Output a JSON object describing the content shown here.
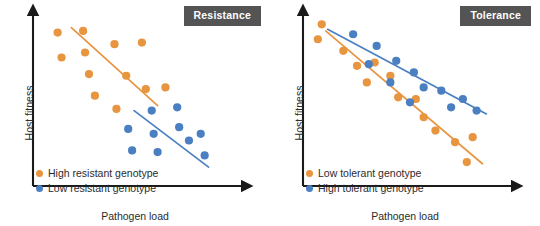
{
  "figure": {
    "background": "#ffffff",
    "colors": {
      "orange": "#E8953F",
      "blue": "#4A7FC1",
      "axis": "#1a1a1a",
      "badge_bg": "#545454",
      "badge_text": "#ffffff",
      "text": "#2b2b2b"
    }
  },
  "panels": [
    {
      "id": "resistance",
      "badge": "Resistance",
      "xlabel": "Pathogen load",
      "ylabel": "Host fitness",
      "legend": [
        {
          "label": "High resistant genotype",
          "color": "#E8953F",
          "series": "orange"
        },
        {
          "label": "Low resistant genotype",
          "color": "#4A7FC1",
          "series": "blue"
        }
      ],
      "chart_data": {
        "type": "scatter",
        "title": "Resistance",
        "xlabel": "Pathogen load",
        "ylabel": "Host fitness",
        "xlim": [
          0,
          100
        ],
        "ylim": [
          0,
          100
        ],
        "grid": false,
        "axis_ticks": false,
        "legend_position": "bottom-left",
        "series": [
          {
            "name": "High resistant genotype",
            "color": "#E8953F",
            "points": [
              [
                9,
                90
              ],
              [
                22,
                91
              ],
              [
                11,
                75
              ],
              [
                23,
                78
              ],
              [
                38,
                83
              ],
              [
                52,
                84
              ],
              [
                25,
                65
              ],
              [
                44,
                64
              ],
              [
                28,
                52
              ],
              [
                54,
                56
              ],
              [
                39,
                44
              ],
              [
                64,
                57
              ]
            ],
            "trend_line": {
              "x0": 16,
              "y0": 93,
              "x1": 60,
              "y1": 46
            }
          },
          {
            "name": "Low resistant genotype",
            "color": "#4A7FC1",
            "points": [
              [
                57,
                43
              ],
              [
                70,
                45
              ],
              [
                45,
                32
              ],
              [
                58,
                29
              ],
              [
                71,
                33
              ],
              [
                47,
                19
              ],
              [
                60,
                18
              ],
              [
                76,
                25
              ],
              [
                82,
                29
              ],
              [
                84,
                16
              ]
            ],
            "trend_line": {
              "x0": 48,
              "y0": 43,
              "x1": 86,
              "y1": 9
            }
          }
        ]
      }
    },
    {
      "id": "tolerance",
      "badge": "Tolerance",
      "xlabel": "Pathogen load",
      "ylabel": "Host fitness",
      "legend": [
        {
          "label": "Low tolerant genotype",
          "color": "#E8953F",
          "series": "orange"
        },
        {
          "label": "High tolerant genotype",
          "color": "#4A7FC1",
          "series": "blue"
        }
      ],
      "chart_data": {
        "type": "scatter",
        "title": "Tolerance",
        "xlabel": "Pathogen load",
        "ylabel": "Host fitness",
        "xlim": [
          0,
          100
        ],
        "ylim": [
          0,
          100
        ],
        "grid": false,
        "axis_ticks": false,
        "legend_position": "bottom-left",
        "series": [
          {
            "name": "Low tolerant genotype",
            "color": "#E8953F",
            "points": [
              [
                6,
                95
              ],
              [
                4,
                86
              ],
              [
                17,
                79
              ],
              [
                24,
                70
              ],
              [
                33,
                72
              ],
              [
                29,
                60
              ],
              [
                41,
                64
              ],
              [
                45,
                51
              ],
              [
                54,
                50
              ],
              [
                58,
                39
              ],
              [
                64,
                31
              ],
              [
                74,
                24
              ],
              [
                83,
                27
              ],
              [
                80,
                12
              ]
            ],
            "trend_line": {
              "x0": 8,
              "y0": 91,
              "x1": 88,
              "y1": 11
            }
          },
          {
            "name": "High tolerant genotype",
            "color": "#4A7FC1",
            "points": [
              [
                22,
                89
              ],
              [
                34,
                82
              ],
              [
                30,
                71
              ],
              [
                44,
                73
              ],
              [
                53,
                66
              ],
              [
                41,
                60
              ],
              [
                58,
                57
              ],
              [
                51,
                48
              ],
              [
                67,
                55
              ],
              [
                72,
                45
              ],
              [
                78,
                50
              ],
              [
                85,
                43
              ]
            ],
            "trend_line": {
              "x0": 9,
              "y0": 92,
              "x1": 90,
              "y1": 41
            }
          }
        ]
      }
    }
  ]
}
